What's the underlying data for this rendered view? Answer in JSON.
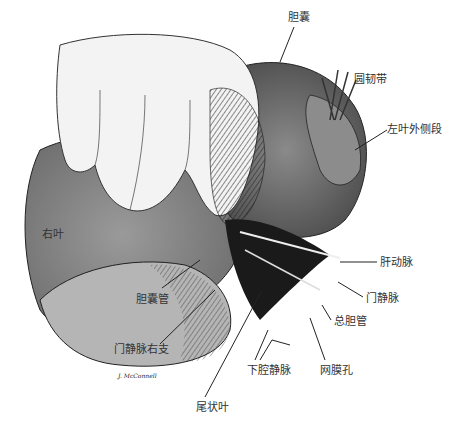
{
  "figure": {
    "type": "anatomical illustration",
    "signature": "J. McConnell"
  },
  "labels": [
    {
      "id": "gallbladder",
      "text": "胆囊",
      "x": 288,
      "y": 18
    },
    {
      "id": "round-ligament",
      "text": "圆韧带",
      "x": 354,
      "y": 74
    },
    {
      "id": "left-lateral-segment",
      "text": "左叶外侧段",
      "x": 387,
      "y": 124
    },
    {
      "id": "right-lobe",
      "text": "右叶",
      "x": 42,
      "y": 229
    },
    {
      "id": "hepatic-artery",
      "text": "肝动脉",
      "x": 380,
      "y": 257
    },
    {
      "id": "portal-vein",
      "text": "门静脉",
      "x": 366,
      "y": 293
    },
    {
      "id": "common-bile-duct",
      "text": "总胆管",
      "x": 334,
      "y": 316
    },
    {
      "id": "cystic-duct",
      "text": "胆囊管",
      "x": 136,
      "y": 294
    },
    {
      "id": "portal-vein-right-branch",
      "text": "门静脉右支",
      "x": 114,
      "y": 344
    },
    {
      "id": "inferior-vena-cava",
      "text": "下腔静脉",
      "x": 247,
      "y": 365
    },
    {
      "id": "omental-foramen",
      "text": "网膜孔",
      "x": 320,
      "y": 365
    },
    {
      "id": "caudate-lobe",
      "text": "尾状叶",
      "x": 196,
      "y": 402
    }
  ]
}
